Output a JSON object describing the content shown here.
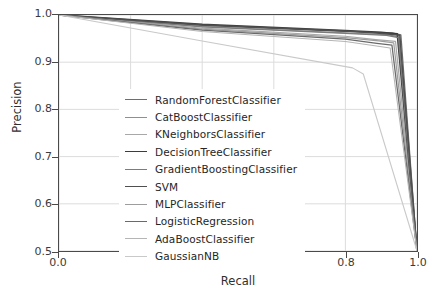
{
  "chart_data": {
    "type": "line",
    "title": "",
    "xlabel": "Recall",
    "ylabel": "Precision",
    "xlim": [
      0.0,
      1.0
    ],
    "ylim": [
      0.5,
      1.0
    ],
    "xticks": [
      "0.0",
      "0.2",
      "0.4",
      "0.6",
      "0.8",
      "1.0"
    ],
    "xtick_values": [
      0.0,
      0.2,
      0.4,
      0.6,
      0.8,
      1.0
    ],
    "yticks": [
      "0.5",
      "0.6",
      "0.7",
      "0.8",
      "0.9",
      "1.0"
    ],
    "ytick_values": [
      0.5,
      0.6,
      0.7,
      0.8,
      0.9,
      1.0
    ],
    "grid": true,
    "legend_position": "lower-left-inside",
    "series": [
      {
        "name": "RandomForestClassifier",
        "color": "#6e6e6e",
        "width": 1.2,
        "x": [
          0.0,
          0.4,
          0.8,
          0.93,
          0.955,
          1.0
        ],
        "y": [
          1.0,
          0.978,
          0.965,
          0.962,
          0.958,
          0.5
        ]
      },
      {
        "name": "CatBoostClassifier",
        "color": "#8f8f8f",
        "width": 1.2,
        "x": [
          0.0,
          0.4,
          0.8,
          0.92,
          0.95,
          1.0
        ],
        "y": [
          1.0,
          0.976,
          0.962,
          0.958,
          0.953,
          0.5
        ]
      },
      {
        "name": "KNeighborsClassifier",
        "color": "#a8a8a8",
        "width": 1.2,
        "x": [
          0.0,
          0.4,
          0.8,
          0.885,
          0.94,
          1.0
        ],
        "y": [
          1.0,
          0.972,
          0.955,
          0.948,
          0.944,
          0.5
        ]
      },
      {
        "name": "DecisionTreeClassifier",
        "color": "#3d3d3d",
        "width": 1.7,
        "x": [
          0.0,
          0.4,
          0.8,
          0.9,
          0.945,
          1.0
        ],
        "y": [
          1.0,
          0.98,
          0.967,
          0.963,
          0.96,
          0.5
        ]
      },
      {
        "name": "GradientBoostingClassifier",
        "color": "#7c7c7c",
        "width": 1.2,
        "x": [
          0.0,
          0.4,
          0.8,
          0.915,
          0.948,
          1.0
        ],
        "y": [
          1.0,
          0.975,
          0.961,
          0.957,
          0.952,
          0.5
        ]
      },
      {
        "name": "SVM",
        "color": "#4f4f4f",
        "width": 1.5,
        "x": [
          0.0,
          0.4,
          0.8,
          0.905,
          0.952,
          1.0
        ],
        "y": [
          1.0,
          0.979,
          0.966,
          0.961,
          0.957,
          0.5
        ]
      },
      {
        "name": "MLPClassifier",
        "color": "#9d9d9d",
        "width": 1.2,
        "x": [
          0.0,
          0.4,
          0.8,
          0.893,
          0.935,
          1.0
        ],
        "y": [
          1.0,
          0.97,
          0.952,
          0.945,
          0.941,
          0.5
        ]
      },
      {
        "name": "LogisticRegression",
        "color": "#6a6a6a",
        "width": 1.3,
        "x": [
          0.0,
          0.4,
          0.8,
          0.888,
          0.93,
          1.0
        ],
        "y": [
          1.0,
          0.968,
          0.949,
          0.94,
          0.936,
          0.5
        ]
      },
      {
        "name": "AdaBoostClassifier",
        "color": "#b5b5b5",
        "width": 1.1,
        "x": [
          0.0,
          0.4,
          0.8,
          0.882,
          0.925,
          1.0
        ],
        "y": [
          1.0,
          0.965,
          0.944,
          0.935,
          0.93,
          0.5
        ]
      },
      {
        "name": "GaussianNB",
        "color": "#c9c9c9",
        "width": 1.1,
        "x": [
          0.0,
          0.4,
          0.82,
          0.85,
          1.0
        ],
        "y": [
          1.0,
          0.945,
          0.888,
          0.875,
          0.5
        ]
      }
    ],
    "style": {
      "grid_color": "#dcdcdc",
      "frame_color": "#4a4a4a",
      "background": "#ffffff",
      "text_color": "#2b2b2b"
    }
  }
}
